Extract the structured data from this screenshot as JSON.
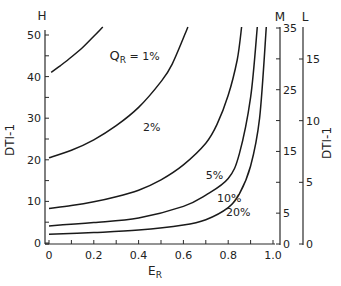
{
  "chart_data": {
    "type": "line",
    "title": "",
    "xlabel": "E",
    "xlabel_sub": "R",
    "ylabel": "DTI-1",
    "xlim": [
      0,
      1.0
    ],
    "x_ticks": [
      "0",
      "0.2",
      "0.4",
      "0.6",
      "0.8",
      "1.0"
    ],
    "x_tick_values": [
      0,
      0.2,
      0.4,
      0.6,
      0.8,
      1.0
    ],
    "x_minor_step": 0.1,
    "axes": [
      {
        "id": "H",
        "label": "H",
        "side": "left",
        "ylim": [
          0,
          50
        ],
        "ticks": [
          "0",
          "10",
          "20",
          "30",
          "40",
          "50"
        ],
        "tick_values": [
          0,
          10,
          20,
          30,
          40,
          50
        ],
        "minor_step": 5
      },
      {
        "id": "M",
        "label": "M",
        "side": "right",
        "ylim": [
          0,
          35
        ],
        "ticks": [
          "0",
          "5",
          "15",
          "25",
          "35"
        ],
        "tick_values": [
          0,
          5,
          15,
          25,
          35
        ],
        "minor_step": 5
      },
      {
        "id": "L",
        "label": "L",
        "side": "right-outer",
        "ylim": [
          0,
          17.5
        ],
        "ticks": [
          "0",
          "5",
          "10",
          "15"
        ],
        "tick_values": [
          0,
          5,
          10,
          15
        ],
        "minor_step": 5,
        "title": "DTI-1"
      }
    ],
    "grid": false,
    "legend": "none (inline curve labels)",
    "series": [
      {
        "name": "Q_R = 1%",
        "label_main": "Q",
        "label_sub": "R",
        "label_rest": " = 1%",
        "x": [
          0.01,
          0.05,
          0.1,
          0.15,
          0.2,
          0.24
        ],
        "y": [
          41,
          42.6,
          44.7,
          47.0,
          49.7,
          52
        ]
      },
      {
        "name": "2%",
        "label_rest": "2%",
        "x": [
          0.0,
          0.1,
          0.2,
          0.3,
          0.4,
          0.5,
          0.55,
          0.62
        ],
        "y": [
          20.5,
          22.3,
          24.8,
          28.2,
          32.6,
          38.8,
          43.0,
          52
        ]
      },
      {
        "name": "5%",
        "label_rest": "5%",
        "x": [
          0.0,
          0.1,
          0.2,
          0.3,
          0.4,
          0.5,
          0.6,
          0.7,
          0.75,
          0.8,
          0.84,
          0.86
        ],
        "y": [
          8.3,
          9.0,
          9.9,
          11.1,
          12.7,
          15.2,
          18.8,
          24.0,
          28.5,
          35.5,
          44.0,
          52
        ]
      },
      {
        "name": "10%",
        "label_rest": "10%",
        "x": [
          0.0,
          0.2,
          0.4,
          0.6,
          0.7,
          0.8,
          0.85,
          0.9,
          0.93
        ],
        "y": [
          4.1,
          4.9,
          6.0,
          8.8,
          11.5,
          15.5,
          21.5,
          35.0,
          52
        ]
      },
      {
        "name": "20%",
        "label_rest": "20%",
        "x": [
          0.0,
          0.2,
          0.4,
          0.6,
          0.7,
          0.8,
          0.85,
          0.9,
          0.94,
          0.97
        ],
        "y": [
          2.1,
          2.5,
          3.1,
          4.3,
          5.6,
          8.5,
          11.8,
          18.5,
          30.0,
          52
        ]
      }
    ],
    "curve_label_positions": [
      {
        "series": 0,
        "x": 0.27,
        "y": 44
      },
      {
        "series": 1,
        "x": 0.42,
        "y": 27
      },
      {
        "series": 2,
        "x": 0.7,
        "y": 15.3
      },
      {
        "series": 3,
        "x": 0.75,
        "y": 9.9
      },
      {
        "series": 4,
        "x": 0.79,
        "y": 6.6
      }
    ]
  }
}
